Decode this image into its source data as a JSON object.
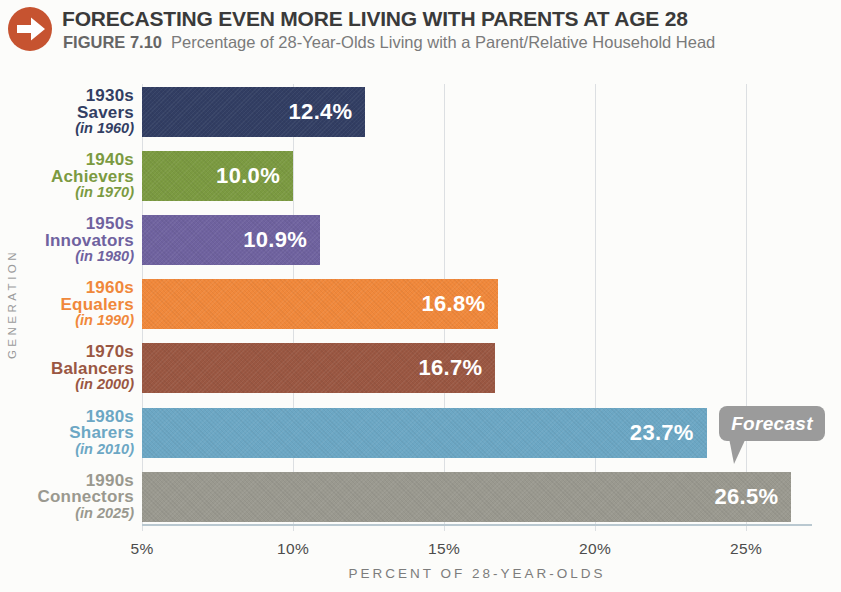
{
  "header": {
    "title": "FORECASTING EVEN MORE LIVING WITH PARENTS AT AGE 28",
    "figure_label": "FIGURE 7.10",
    "figure_caption": "Percentage of 28-Year-Olds Living with a Parent/Relative Household Head",
    "icon_color": "#c65330"
  },
  "chart_data": {
    "type": "bar",
    "orientation": "horizontal",
    "title": "FORECASTING EVEN MORE LIVING WITH PARENTS AT AGE 28",
    "subtitle": "Percentage of 28-Year-Olds Living with a Parent/Relative Household Head",
    "categories": [
      "1930s Savers (in 1960)",
      "1940s Achievers (in 1970)",
      "1950s Innovators (in 1980)",
      "1960s Equalers (in 1990)",
      "1970s Balancers (in 2000)",
      "1980s Sharers (in 2010)",
      "1990s Connectors (in 2025)"
    ],
    "values": [
      12.4,
      10.0,
      10.9,
      16.8,
      16.7,
      23.7,
      26.5
    ],
    "bars": [
      {
        "decade": "1930s",
        "group": "Savers",
        "note": "(in 1960)",
        "value": 12.4,
        "label": "12.4%",
        "color": "#323e63"
      },
      {
        "decade": "1940s",
        "group": "Achievers",
        "note": "(in 1970)",
        "value": 10.0,
        "label": "10.0%",
        "color": "#7b9a41"
      },
      {
        "decade": "1950s",
        "group": "Innovators",
        "note": "(in 1980)",
        "value": 10.9,
        "label": "10.9%",
        "color": "#6f629f"
      },
      {
        "decade": "1960s",
        "group": "Equalers",
        "note": "(in 1990)",
        "value": 16.8,
        "label": "16.8%",
        "color": "#f0883b"
      },
      {
        "decade": "1970s",
        "group": "Balancers",
        "note": "(in 2000)",
        "value": 16.7,
        "label": "16.7%",
        "color": "#9a5742"
      },
      {
        "decade": "1980s",
        "group": "Sharers",
        "note": "(in 2010)",
        "value": 23.7,
        "label": "23.7%",
        "color": "#6ca7c4",
        "annotation": "Forecast"
      },
      {
        "decade": "1990s",
        "group": "Connectors",
        "note": "(in 2025)",
        "value": 26.5,
        "label": "26.5%",
        "color": "#9a998f"
      }
    ],
    "xlabel": "PERCENT OF 28-YEAR-OLDS",
    "ylabel": "GENERATION",
    "xlim": [
      5,
      27.2
    ],
    "x_ticks": [
      5,
      10,
      15,
      20,
      25
    ],
    "x_tick_labels": [
      "5%",
      "10%",
      "15%",
      "20%",
      "25%"
    ],
    "grid": "vertical-gridlines-on",
    "legend": "none",
    "annotation": {
      "text": "Forecast",
      "target": "1980s Sharers (in 2010)",
      "bubble_color": "#9b9b9b"
    }
  }
}
